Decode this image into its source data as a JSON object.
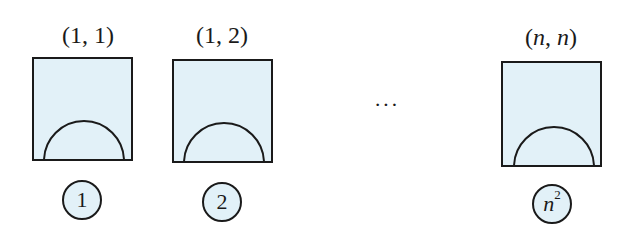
{
  "diagram": {
    "fill_color": "#e2f1f8",
    "stroke_color": "#1a1a1a",
    "tiles": [
      {
        "coord": "(1, 1)",
        "index": "1"
      },
      {
        "coord": "(1, 2)",
        "index": "2"
      },
      {
        "coord_open": "(",
        "coord_var1": "n",
        "coord_sep": ", ",
        "coord_var2": "n",
        "coord_close": ")",
        "index_base": "n",
        "index_exp": "2"
      }
    ],
    "ellipsis": "···"
  }
}
